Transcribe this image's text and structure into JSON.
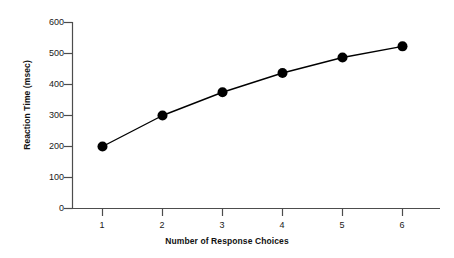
{
  "chart_data": {
    "type": "line",
    "title": "",
    "xlabel": "Number of Response Choices",
    "ylabel": "Reaction Time (msec)",
    "x": [
      1,
      2,
      3,
      4,
      5,
      6
    ],
    "values": [
      200,
      300,
      375,
      437,
      487,
      523
    ],
    "categories": [
      "1",
      "2",
      "3",
      "4",
      "5",
      "6"
    ],
    "xtick_labels": [
      "1",
      "2",
      "3",
      "4",
      "5",
      "6"
    ],
    "ytick_labels": [
      "0",
      "100",
      "200",
      "300",
      "400",
      "500",
      "600"
    ],
    "ytick_values": [
      0,
      100,
      200,
      300,
      400,
      500,
      600
    ],
    "xlim": [
      0.5,
      6.6
    ],
    "ylim": [
      0,
      600
    ],
    "grid": false,
    "legend": null,
    "series": [
      {
        "name": "Reaction Time",
        "values": [
          200,
          300,
          375,
          437,
          487,
          523
        ],
        "marker": "filled-circle",
        "color": "#000000",
        "line_color": "#000000"
      }
    ],
    "annotations": []
  },
  "axes": {
    "y_title": "Reaction Time (msec)",
    "x_title": "Number of Response Choices",
    "axis_color": "#4d4d4d"
  },
  "marker": {
    "shape_name": "filled-circle-marker"
  }
}
